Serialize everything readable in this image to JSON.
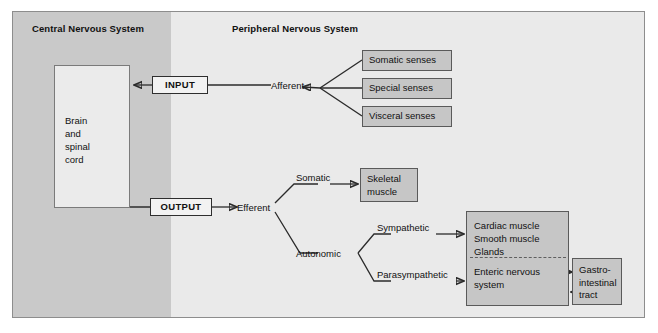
{
  "diagram": {
    "title_cns": "Central Nervous System",
    "title_pns": "Peripheral Nervous System",
    "colors": {
      "cns_band": "#c9c9c9",
      "pns_band": "#eaeaea",
      "box_fill": "#c6c6c6",
      "box_border": "#5a5a5a",
      "line": "#2b2b2b",
      "frame_bg": "#ececec"
    }
  },
  "cns": {
    "brain_box_label": "Brain\nand\nspinal\ncord",
    "brain_line_1": "Brain",
    "brain_line_2": "and",
    "brain_line_3": "spinal",
    "brain_line_4": "cord"
  },
  "io": {
    "input_label": "INPUT",
    "output_label": "OUTPUT"
  },
  "pathways": {
    "afferent_label": "Afferent",
    "efferent_label": "Efferent",
    "somatic_label": "Somatic",
    "autonomic_label": "Autonomic",
    "sympathetic_label": "Sympathetic",
    "parasympathetic_label": "Parasympathetic"
  },
  "sensory_boxes": [
    {
      "label": "Somatic senses"
    },
    {
      "label": "Special senses"
    },
    {
      "label": "Visceral senses"
    }
  ],
  "effector_boxes": {
    "skeletal_line_1": "Skeletal",
    "skeletal_line_2": "muscle",
    "autonomic_target_line_1": "Cardiac muscle",
    "autonomic_target_line_2": "Smooth muscle",
    "autonomic_target_line_3": "Glands",
    "enteric_line_1": "Enteric nervous",
    "enteric_line_2": "system",
    "gi_line_1": "Gastro-",
    "gi_line_2": "intestinal",
    "gi_line_3": "tract"
  }
}
